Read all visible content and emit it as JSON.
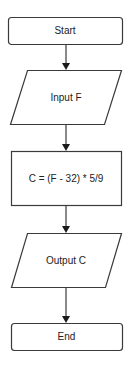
{
  "diagram": {
    "type": "flowchart",
    "nodes": [
      {
        "id": "start",
        "shape": "terminator",
        "label": "Start"
      },
      {
        "id": "input",
        "shape": "parallelogram",
        "label": "Input F"
      },
      {
        "id": "process",
        "shape": "rectangle",
        "label": "C = (F - 32) * 5/9"
      },
      {
        "id": "output",
        "shape": "parallelogram",
        "label": "Output C"
      },
      {
        "id": "end",
        "shape": "terminator",
        "label": "End"
      }
    ],
    "edges": [
      {
        "from": "start",
        "to": "input"
      },
      {
        "from": "input",
        "to": "process"
      },
      {
        "from": "process",
        "to": "output"
      },
      {
        "from": "output",
        "to": "end"
      }
    ],
    "colors": {
      "stroke": "#3a3a3a",
      "fill": "#ffffff",
      "text": "#222222"
    }
  }
}
